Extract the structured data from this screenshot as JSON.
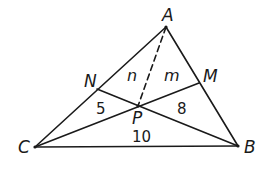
{
  "diagram": {
    "type": "triangle-cevians",
    "points": {
      "A": {
        "label": "A",
        "x": 166,
        "y": 27
      },
      "B": {
        "label": "B",
        "x": 238,
        "y": 146
      },
      "C": {
        "label": "C",
        "x": 35,
        "y": 147
      },
      "M": {
        "label": "M",
        "x": 199,
        "y": 83
      },
      "N": {
        "label": "N",
        "x": 97,
        "y": 89
      },
      "P": {
        "label": "P",
        "x": 138,
        "y": 106
      }
    },
    "segments": [
      {
        "from": "A",
        "to": "B",
        "style": "solid"
      },
      {
        "from": "B",
        "to": "C",
        "style": "solid"
      },
      {
        "from": "C",
        "to": "A",
        "style": "solid"
      },
      {
        "from": "C",
        "to": "M",
        "style": "solid"
      },
      {
        "from": "B",
        "to": "N",
        "style": "solid"
      },
      {
        "from": "A",
        "to": "P",
        "style": "dashed"
      }
    ],
    "region_labels": {
      "n": "n",
      "m": "m",
      "area_CPN": "5",
      "area_BPM": "8",
      "area_BPC": "10"
    },
    "stroke_color": "#1a1a1a"
  }
}
